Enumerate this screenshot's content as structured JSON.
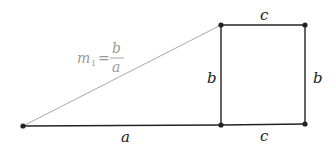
{
  "diagram": {
    "points": {
      "origin": {
        "x": 23,
        "y": 126
      },
      "square_bottom_left": {
        "x": 221,
        "y": 125
      },
      "square_top_left": {
        "x": 221,
        "y": 25
      },
      "square_top_right": {
        "x": 305,
        "y": 25
      },
      "square_bottom_right": {
        "x": 305,
        "y": 124
      }
    },
    "labels": {
      "bottom_a": "a",
      "bottom_c": "c",
      "top_c": "c",
      "left_b": "b",
      "right_b": "b",
      "slope": {
        "m": "m",
        "sub": "1",
        "eq": "=",
        "numerator": "b",
        "denominator": "a"
      }
    },
    "colors": {
      "edge": "#222222",
      "hypotenuse": "#a8a8a8",
      "slope_label": "#9a9a9a"
    }
  }
}
